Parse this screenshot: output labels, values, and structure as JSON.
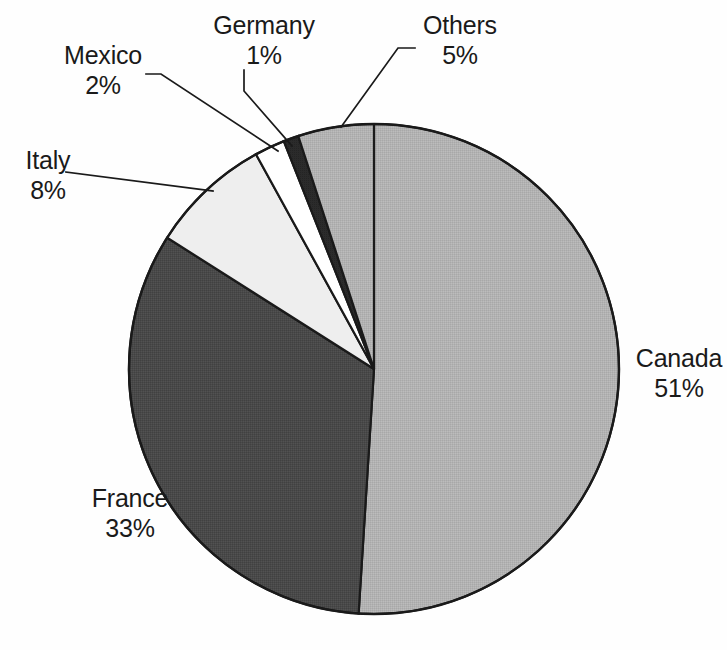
{
  "chart_data": {
    "type": "pie",
    "title": "",
    "subtitle": "",
    "xlabel": "",
    "ylabel": "",
    "legend_position": "none",
    "grid": false,
    "units": "percent",
    "start_angle_deg": 0,
    "note": "Slices start at 12 o'clock. Canada sweeps clockwise; the remaining slices continue clockwise around the bottom and up the left side back to 12 o'clock.",
    "categories": [
      "Canada",
      "France",
      "Italy",
      "Mexico",
      "Germany",
      "Others"
    ],
    "values": [
      51,
      33,
      8,
      2,
      1,
      5
    ],
    "total": 100,
    "slices": [
      {
        "label": "Canada",
        "value": 51,
        "value_text": "51%",
        "color": "#b2b2b2",
        "leader_line": false
      },
      {
        "label": "France",
        "value": 33,
        "value_text": "33%",
        "color": "#494949",
        "leader_line": false
      },
      {
        "label": "Italy",
        "value": 8,
        "value_text": "8%",
        "color": "#eeeeee",
        "leader_line": true
      },
      {
        "label": "Mexico",
        "value": 2,
        "value_text": "2%",
        "color": "#ffffff",
        "leader_line": true
      },
      {
        "label": "Germany",
        "value": 1,
        "value_text": "1%",
        "color": "#2b2b2b",
        "leader_line": true
      },
      {
        "label": "Others",
        "value": 5,
        "value_text": "5%",
        "color": "#b2b2b2",
        "leader_line": true
      }
    ],
    "ylim": [
      0,
      100
    ]
  },
  "colors": {
    "background": "#fefefe",
    "outline": "#1a1a1a",
    "text": "#1a1a1a",
    "leader_line": "#1a1a1a",
    "canada": "#b2b2b2",
    "france": "#494949",
    "italy": "#eeeeee",
    "mexico": "#ffffff",
    "germany": "#2b2b2b",
    "others": "#b2b2b2"
  },
  "labels": {
    "canada": {
      "name": "Canada",
      "pct": "51%"
    },
    "france": {
      "name": "France",
      "pct": "33%"
    },
    "italy": {
      "name": "Italy",
      "pct": "8%"
    },
    "mexico": {
      "name": "Mexico",
      "pct": "2%"
    },
    "germany": {
      "name": "Germany",
      "pct": "1%"
    },
    "others": {
      "name": "Others",
      "pct": "5%"
    }
  }
}
